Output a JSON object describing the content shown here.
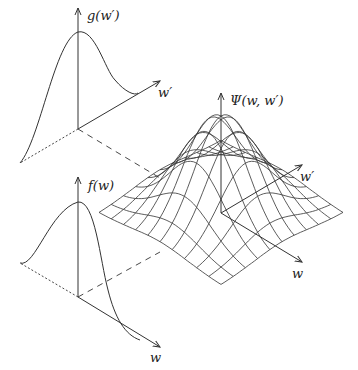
{
  "diagram": {
    "labels": {
      "g_axis": "g(w′)",
      "g_horizontal": "w′",
      "f_axis": "f(w)",
      "f_horizontal": "w",
      "psi_axis": "Ψ(w, w′)",
      "psi_wprime": "w′",
      "psi_w": "w"
    },
    "stroke_color": "#333333",
    "background": "#ffffff",
    "grid": {
      "cells": 10,
      "center": [
        221,
        213
      ],
      "half_width": 122,
      "half_height": 72,
      "peak_height": 97,
      "sigma": 0.22
    }
  }
}
